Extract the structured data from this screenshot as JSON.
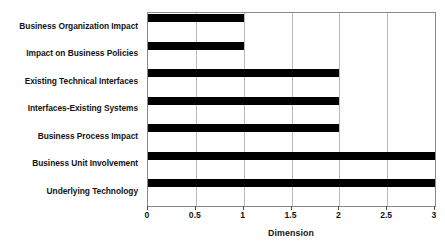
{
  "chart_data": {
    "type": "bar",
    "orientation": "horizontal",
    "title": "",
    "xlabel": "Dimension",
    "ylabel": "",
    "xlim": [
      0,
      3
    ],
    "ylim": null,
    "grid": "vertical",
    "legend": null,
    "xticks": [
      "0",
      "0.5",
      "1",
      "1.5",
      "2",
      "2.5",
      "3"
    ],
    "xtick_values": [
      0,
      0.5,
      1,
      1.5,
      2,
      2.5,
      3
    ],
    "categories": [
      "Business Organization Impact",
      "Impact on Business Policies",
      "Existing Technical Interfaces",
      "Interfaces-Existing Systems",
      "Business Process Impact",
      "Business Unit Involvement",
      "Underlying Technology"
    ],
    "values": [
      1,
      1,
      2,
      2,
      2,
      3,
      3
    ],
    "bar_color": "#000000",
    "grid_color": "#b9b9b9",
    "axis_color": "#8a8a8a",
    "background_color": "#ffffff"
  }
}
